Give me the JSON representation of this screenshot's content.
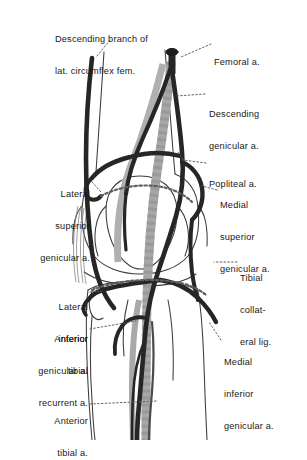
{
  "figure": {
    "view": "anterior-right-knee",
    "background_color": "#ffffff",
    "artery_color": "#262626",
    "bone_outline_color": "#3a3a3a",
    "ligament_color": "#9a9a9a",
    "leader_line_color": "#555555",
    "leader_line_style": "dotted"
  },
  "labels": [
    {
      "id": "descending-branch-lat-circumflex",
      "line1": "Descending branch of",
      "line2": "lat. circumflex fem.",
      "align": "left",
      "x": 55,
      "y": 13,
      "width": 125
    },
    {
      "id": "femoral-artery",
      "line1": "Femoral a.",
      "line2": "",
      "align": "left",
      "x": 214,
      "y": 36,
      "width": 88
    },
    {
      "id": "descending-genicular",
      "line1": "Descending",
      "line2": "genicular a.",
      "align": "left",
      "x": 209,
      "y": 88,
      "width": 92
    },
    {
      "id": "popliteal-artery",
      "line1": "Popliteal a.",
      "line2": "",
      "align": "left",
      "x": 209,
      "y": 158,
      "width": 92
    },
    {
      "id": "lateral-superior-genicular",
      "line1": "Lateral",
      "line2": "superior",
      "line3": "genicular a.",
      "align": "right",
      "x": 8,
      "y": 168,
      "width": 82
    },
    {
      "id": "medial-superior-genicular",
      "line1": "Medial",
      "line2": "superior",
      "line3": "genicular a.",
      "align": "left",
      "x": 220,
      "y": 179,
      "width": 84
    },
    {
      "id": "tibial-collateral-ligament",
      "line1": "Tibial",
      "line2": "collat-",
      "line3": "eral lig.",
      "align": "left",
      "x": 240,
      "y": 252,
      "width": 62
    },
    {
      "id": "lateral-inferior-genicular",
      "line1": "Lateral",
      "line2": "inferior",
      "line3": "genicular a.",
      "align": "right",
      "x": 4,
      "y": 281,
      "width": 84
    },
    {
      "id": "anterior-tibial-recurrent",
      "line1": "Anterior",
      "line2": "tibial",
      "line3": "recurrent a.",
      "align": "right",
      "x": 4,
      "y": 313,
      "width": 84
    },
    {
      "id": "medial-inferior-genicular",
      "line1": "Medial",
      "line2": "inferior",
      "line3": "genicular a.",
      "align": "left",
      "x": 224,
      "y": 336,
      "width": 82
    },
    {
      "id": "anterior-tibial",
      "line1": "Anterior",
      "line2": "tibial a.",
      "line3": "",
      "align": "right",
      "x": 20,
      "y": 395,
      "width": 68
    }
  ],
  "structures": [
    {
      "id": "femur-shaft",
      "kind": "bone",
      "name": "Femur"
    },
    {
      "id": "patella",
      "kind": "bone",
      "name": "Patella"
    },
    {
      "id": "tibia",
      "kind": "bone",
      "name": "Tibia"
    },
    {
      "id": "fibula",
      "kind": "bone",
      "name": "Fibula"
    },
    {
      "id": "femoral-artery-vessel",
      "kind": "artery",
      "name": "Femoral a."
    },
    {
      "id": "popliteal-artery-vessel",
      "kind": "artery",
      "name": "Popliteal a."
    },
    {
      "id": "descending-genicular-vessel",
      "kind": "artery",
      "name": "Descending genicular a."
    },
    {
      "id": "lateral-superior-genicular-vessel",
      "kind": "artery",
      "name": "Lateral superior genicular a."
    },
    {
      "id": "medial-superior-genicular-vessel",
      "kind": "artery",
      "name": "Medial superior genicular a."
    },
    {
      "id": "lateral-inferior-genicular-vessel",
      "kind": "artery",
      "name": "Lateral inferior genicular a."
    },
    {
      "id": "medial-inferior-genicular-vessel",
      "kind": "artery",
      "name": "Medial inferior genicular a."
    },
    {
      "id": "anterior-tibial-recurrent-vessel",
      "kind": "artery",
      "name": "Anterior tibial recurrent a."
    },
    {
      "id": "anterior-tibial-vessel",
      "kind": "artery",
      "name": "Anterior tibial a."
    },
    {
      "id": "descending-branch-vessel",
      "kind": "artery",
      "name": "Descending branch of lat. circumflex fem."
    },
    {
      "id": "tibial-collateral-lig-band",
      "kind": "ligament",
      "name": "Tibial collateral lig."
    }
  ]
}
